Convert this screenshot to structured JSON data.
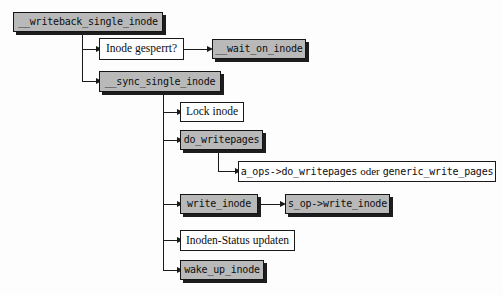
{
  "diagram": {
    "background_color": "#fdfdfd",
    "code_box_color": "#b9b9b9",
    "plain_box_color": "#ffffff",
    "line_color": "#1a1a1a",
    "nodes": [
      {
        "id": "writeback_single_inode",
        "label": "__writeback_single_inode",
        "style": "code"
      },
      {
        "id": "inode_gesperrt",
        "label": "Inode gesperrt?",
        "style": "plain"
      },
      {
        "id": "wait_on_inode",
        "label": "__wait_on_inode",
        "style": "code"
      },
      {
        "id": "sync_single_inode",
        "label": "__sync_single_inode",
        "style": "code"
      },
      {
        "id": "lock_inode",
        "label": "Lock inode",
        "style": "plain"
      },
      {
        "id": "do_writepages",
        "label": "do_writepages",
        "style": "code"
      },
      {
        "id": "a_ops_writepages",
        "label": "a_ops->do_writepages oder generic_write_pages",
        "style": "mixed",
        "parts": [
          {
            "text": "a_ops->do_writepages",
            "font": "mono"
          },
          {
            "text": "oder",
            "font": "serif"
          },
          {
            "text": "generic_write_pages",
            "font": "mono"
          }
        ]
      },
      {
        "id": "write_inode",
        "label": "write_inode",
        "style": "code"
      },
      {
        "id": "s_op_write_inode",
        "label": "s_op->write_inode",
        "style": "code"
      },
      {
        "id": "inoden_status",
        "label": "Inoden-Status updaten",
        "style": "plain"
      },
      {
        "id": "wake_up_inode",
        "label": "wake_up_inode",
        "style": "code"
      }
    ],
    "edges": [
      {
        "from": "writeback_single_inode",
        "to": "inode_gesperrt"
      },
      {
        "from": "writeback_single_inode",
        "to": "sync_single_inode"
      },
      {
        "from": "inode_gesperrt",
        "to": "wait_on_inode"
      },
      {
        "from": "sync_single_inode",
        "to": "lock_inode"
      },
      {
        "from": "sync_single_inode",
        "to": "do_writepages"
      },
      {
        "from": "sync_single_inode",
        "to": "write_inode"
      },
      {
        "from": "sync_single_inode",
        "to": "inoden_status"
      },
      {
        "from": "sync_single_inode",
        "to": "wake_up_inode"
      },
      {
        "from": "do_writepages",
        "to": "a_ops_writepages"
      },
      {
        "from": "write_inode",
        "to": "s_op_write_inode"
      }
    ]
  }
}
